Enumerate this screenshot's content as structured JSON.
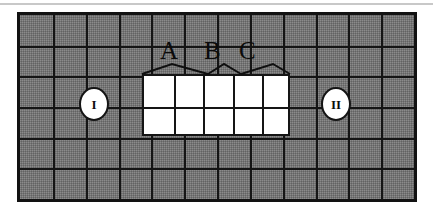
{
  "figure": {
    "background_color": "#ffffff",
    "field_color": "#757575",
    "line_color": "#151515",
    "cleared_color": "#ffffff"
  },
  "grid": {
    "columns": 12,
    "rows": 6,
    "cell_width": 33,
    "cell_height": 31,
    "frame": {
      "x": 17,
      "y": 12,
      "width": 400,
      "height": 190
    },
    "border_width": 3
  },
  "cleared_block": {
    "label": "cleared-region",
    "columns": 5,
    "rows": 2,
    "start_column": 4,
    "start_row": 3,
    "x": 142,
    "y": 74,
    "width": 148,
    "height": 62
  },
  "markers": [
    {
      "name": "marker-one",
      "label": "I",
      "x": 79,
      "y": 87
    },
    {
      "name": "marker-two",
      "label": "II",
      "x": 321,
      "y": 87
    }
  ],
  "spans": [
    {
      "name": "span-a",
      "label": "A",
      "cells": 2,
      "start": 0,
      "label_x": 160,
      "label_y": 38,
      "peak_x": 172
    },
    {
      "name": "span-b",
      "label": "B",
      "cells": 1,
      "start": 2,
      "label_x": 204,
      "label_y": 38,
      "peak_x": 216
    },
    {
      "name": "span-c",
      "label": "C",
      "cells": 2,
      "start": 3,
      "label_x": 239,
      "label_y": 38,
      "peak_x": 250
    }
  ],
  "brackets": {
    "baseline_y": 74,
    "peak_rise": 10,
    "stroke_width": 2,
    "stroke_color": "#0f0f0f",
    "segments": [
      {
        "name": "bracket-a",
        "left": 142,
        "peak": 172,
        "right": 208
      },
      {
        "name": "bracket-b",
        "left": 208,
        "peak": 224,
        "right": 241
      },
      {
        "name": "bracket-c",
        "left": 241,
        "peak": 273,
        "right": 290
      }
    ]
  },
  "top_rule": {
    "name": "top-rule",
    "color": "#c8c8c8"
  }
}
